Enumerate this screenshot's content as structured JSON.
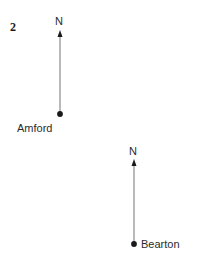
{
  "figure": {
    "question_number": "2",
    "background_color": "#ffffff",
    "line_color": "#808080",
    "marker_color": "#1a1a1a",
    "text_color": "#2b2b2b",
    "width": 198,
    "height": 275
  },
  "diagrams": [
    {
      "id": "amford",
      "place_label": "Amford",
      "north_label": "N",
      "marker": {
        "cx": 60,
        "cy": 114,
        "r": 2.9
      },
      "arrow": {
        "x": 60,
        "y_tail": 114,
        "y_tip": 30,
        "head_width": 5,
        "head_length": 7
      },
      "north_label_pos": {
        "x": 55,
        "y": 15
      },
      "place_label_pos": {
        "x": 17,
        "y": 122
      }
    },
    {
      "id": "bearton",
      "place_label": "Bearton",
      "north_label": "N",
      "marker": {
        "cx": 134,
        "cy": 244,
        "r": 2.9
      },
      "arrow": {
        "x": 134,
        "y_tail": 244,
        "y_tip": 159,
        "head_width": 5,
        "head_length": 7
      },
      "north_label_pos": {
        "x": 129,
        "y": 145
      },
      "place_label_pos": {
        "x": 141,
        "y": 238
      }
    }
  ]
}
